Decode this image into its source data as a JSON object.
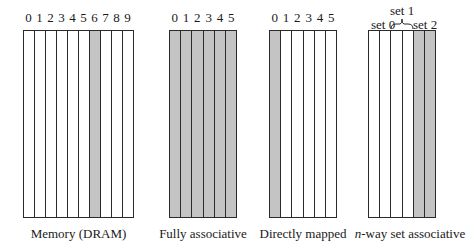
{
  "panels": [
    {
      "id": "memory",
      "caption": "Memory (DRAM)",
      "indices": [
        "0",
        "1",
        "2",
        "3",
        "4",
        "5",
        "6",
        "7",
        "8",
        "9"
      ],
      "shaded": [
        false,
        false,
        false,
        false,
        false,
        false,
        true,
        false,
        false,
        false
      ]
    },
    {
      "id": "fully-associative",
      "caption": "Fully associative",
      "indices": [
        "0",
        "1",
        "2",
        "3",
        "4",
        "5"
      ],
      "shaded": [
        true,
        true,
        true,
        true,
        true,
        true
      ]
    },
    {
      "id": "directly-mapped",
      "caption": "Directly mapped",
      "indices": [
        "0",
        "1",
        "2",
        "3",
        "4",
        "5"
      ],
      "shaded": [
        true,
        false,
        false,
        false,
        false,
        false
      ]
    },
    {
      "id": "n-way",
      "caption_italic": "n",
      "caption_rest": "-way set associative",
      "set_labels": {
        "set0": "set 0",
        "set1": "set 1",
        "set2": "set 2"
      },
      "shaded": [
        false,
        false,
        false,
        false,
        true,
        true
      ]
    }
  ],
  "colors": {
    "shaded": "#c4c4c4",
    "line": "#2a2a2a"
  }
}
